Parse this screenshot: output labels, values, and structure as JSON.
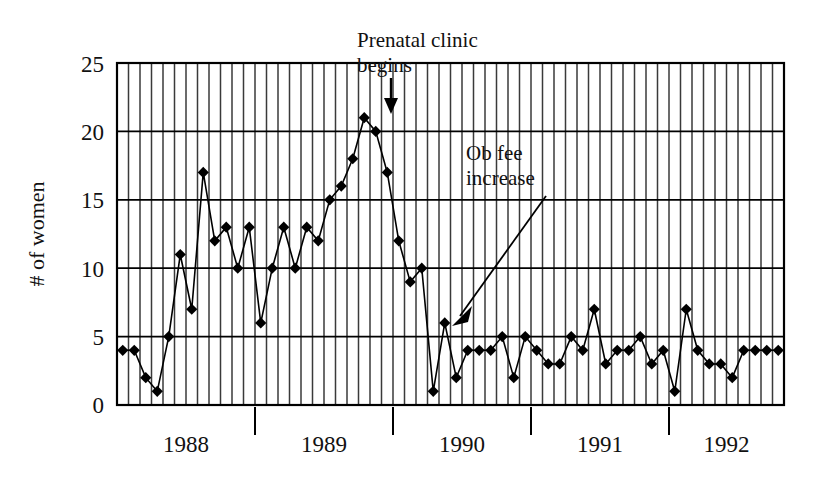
{
  "chart_data": {
    "type": "line",
    "title": "",
    "xlabel": "",
    "ylabel": "# of women",
    "ylim": [
      0,
      25
    ],
    "yticks": [
      0,
      5,
      10,
      15,
      20,
      25
    ],
    "ytick_labels": [
      "0",
      "5",
      "10",
      "15",
      "20",
      "25"
    ],
    "grid": "vertical monthly gridlines plus horizontal lines at every 5 units",
    "legend": "none",
    "x_axis_type": "monthly, labeled by year",
    "year_labels": [
      "1988",
      "1989",
      "1990",
      "1991",
      "1992"
    ],
    "year_boundaries_after_index": [
      11,
      23,
      35,
      47
    ],
    "x": [
      "1987-09",
      "1987-10",
      "1987-11",
      "1987-12",
      "1988-01",
      "1988-02",
      "1988-03",
      "1988-04",
      "1988-05",
      "1988-06",
      "1988-07",
      "1988-08",
      "1988-09",
      "1988-10",
      "1988-11",
      "1988-12",
      "1989-01",
      "1989-02",
      "1989-03",
      "1989-04",
      "1989-05",
      "1989-06",
      "1989-07",
      "1989-08",
      "1989-09",
      "1989-10",
      "1989-11",
      "1989-12",
      "1990-01",
      "1990-02",
      "1990-03",
      "1990-04",
      "1990-05",
      "1990-06",
      "1990-07",
      "1990-08",
      "1990-09",
      "1990-10",
      "1990-11",
      "1990-12",
      "1991-01",
      "1991-02",
      "1991-03",
      "1991-04",
      "1991-05",
      "1991-06",
      "1991-07",
      "1991-08",
      "1991-09",
      "1991-10",
      "1991-11",
      "1991-12",
      "1992-01",
      "1992-02",
      "1992-03",
      "1992-04",
      "1992-05",
      "1992-06"
    ],
    "values": [
      4,
      4,
      2,
      1,
      5,
      11,
      7,
      17,
      12,
      13,
      10,
      13,
      6,
      10,
      13,
      10,
      13,
      12,
      15,
      16,
      18,
      21,
      20,
      17,
      12,
      9,
      10,
      1,
      6,
      2,
      4,
      4,
      4,
      5,
      2,
      5,
      4,
      3,
      3,
      5,
      4,
      7,
      3,
      4,
      4,
      5,
      3,
      4,
      1,
      7,
      4,
      3,
      3,
      2,
      4,
      4,
      4,
      4
    ],
    "series": [
      {
        "name": "# of women",
        "marker": "filled diamond",
        "color": "#000000",
        "values": [
          4,
          4,
          2,
          1,
          5,
          11,
          7,
          17,
          12,
          13,
          10,
          13,
          6,
          10,
          13,
          10,
          13,
          12,
          15,
          16,
          18,
          21,
          20,
          17,
          12,
          9,
          10,
          1,
          6,
          2,
          4,
          4,
          4,
          5,
          2,
          5,
          4,
          3,
          3,
          5,
          4,
          7,
          3,
          4,
          4,
          5,
          3,
          4,
          1,
          7,
          4,
          3,
          3,
          2,
          4,
          4,
          4,
          4
        ]
      }
    ],
    "annotations": [
      {
        "id": "prenatal-clinic",
        "text_line1": "Prenatal clinic",
        "text_line2": "begins",
        "arrow": "down",
        "points_to_index": 23,
        "points_to_value": 20
      },
      {
        "id": "ob-fee-increase",
        "text_line1": "Ob fee",
        "text_line2": "increase",
        "arrow": "diagonal-down-left",
        "points_to_index": 28,
        "points_to_value": 6
      }
    ]
  },
  "axes": {
    "y_label": "# of women",
    "y_tick_25": "25",
    "y_tick_20": "20",
    "y_tick_15": "15",
    "y_tick_10": "10",
    "y_tick_5": "5",
    "y_tick_0": "0"
  },
  "years": {
    "y1988": "1988",
    "y1989": "1989",
    "y1990": "1990",
    "y1991": "1991",
    "y1992": "1992"
  },
  "annotations": {
    "prenatal_line1": "Prenatal clinic",
    "prenatal_line2": "begins",
    "obfee_line1": "Ob fee",
    "obfee_line2": "increase"
  },
  "colors": {
    "line": "#000000",
    "marker": "#000000",
    "grid": "#3a3a3a",
    "axis": "#000000",
    "background": "#ffffff"
  }
}
